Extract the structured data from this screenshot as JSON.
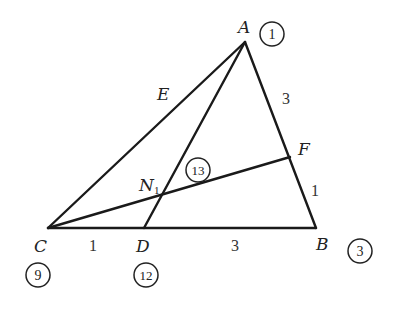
{
  "diagram": {
    "type": "geometry-triangle",
    "points": {
      "A": {
        "label": "A",
        "x": 245,
        "y": 42,
        "circled": "1"
      },
      "B": {
        "label": "B",
        "x": 316,
        "y": 228,
        "circled": "3"
      },
      "C": {
        "label": "C",
        "x": 48,
        "y": 228,
        "circled": "9"
      },
      "D": {
        "label": "D",
        "x": 144,
        "y": 228,
        "circled": "12"
      },
      "E": {
        "label": "E"
      },
      "F": {
        "label": "F",
        "x": 290,
        "y": 157
      },
      "N": {
        "label": "N",
        "sub": "1",
        "x": 160,
        "y": 197,
        "circled": "13"
      }
    },
    "segments": [
      "AB",
      "AC",
      "BC",
      "AD",
      "CF"
    ],
    "lengths": {
      "CD": "1",
      "DB": "3",
      "AF": "3",
      "FB": "1"
    },
    "stroke_color": "#1a1a1a"
  }
}
